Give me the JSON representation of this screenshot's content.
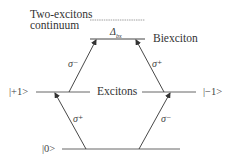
{
  "diagram": {
    "labels": {
      "continuum_line1": "Two-excitons",
      "continuum_line2": "continuum",
      "biexciton": "Biexciton",
      "binding_energy": "Δ",
      "binding_energy_sub": "bx",
      "excitons": "Excitons",
      "state_plus": "|+1>",
      "state_minus": "|−1>",
      "state_ground": "|0>"
    },
    "transitions": [
      {
        "from": "|0>",
        "to": "|+1>",
        "polarization": "σ⁺",
        "position": "lower-left"
      },
      {
        "from": "|0>",
        "to": "|−1>",
        "polarization": "σ⁻",
        "position": "lower-right"
      },
      {
        "from": "|+1>",
        "to": "Biexciton",
        "polarization": "σ⁻",
        "position": "upper-left"
      },
      {
        "from": "|−1>",
        "to": "Biexciton",
        "polarization": "σ⁺",
        "position": "upper-right"
      }
    ],
    "colors": {
      "line": "#555555",
      "dashed_line": "#888888",
      "text": "#333333"
    }
  }
}
